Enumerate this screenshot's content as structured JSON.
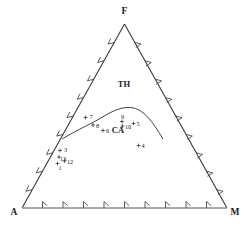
{
  "chart_data": {
    "type": "scatter",
    "title": "",
    "subtitle": "",
    "xlabel": "",
    "ylabel": "",
    "plot_kind": "ternary-afm-diagram",
    "grid": false,
    "legend_position": "none",
    "axis_ranges": {
      "a": [
        0,
        100
      ],
      "f": [
        0,
        100
      ],
      "m": [
        0,
        100
      ]
    },
    "apices": [
      {
        "id": "apex-f",
        "label": "F",
        "position": "top",
        "px": {
          "x": 124.5,
          "y": 14
        }
      },
      {
        "id": "apex-a",
        "label": "A",
        "position": "bottom-left",
        "px": {
          "x": 14,
          "y": 215
        }
      },
      {
        "id": "apex-m",
        "label": "M",
        "position": "bottom-right",
        "px": {
          "x": 235,
          "y": 215
        }
      }
    ],
    "fields": [
      {
        "id": "field-th",
        "label": "TH",
        "px": {
          "x": 124,
          "y": 87
        }
      },
      {
        "id": "field-ca",
        "label": "CA",
        "px": {
          "x": 118,
          "y": 133
        }
      }
    ],
    "ticks_per_edge": 9,
    "divider_curve_px": [
      {
        "x": 62,
        "y": 139
      },
      {
        "x": 76,
        "y": 131
      },
      {
        "x": 90,
        "y": 124
      },
      {
        "x": 101,
        "y": 118
      },
      {
        "x": 111,
        "y": 112
      },
      {
        "x": 121,
        "y": 108
      },
      {
        "x": 131,
        "y": 107
      },
      {
        "x": 140,
        "y": 110
      },
      {
        "x": 148,
        "y": 117
      },
      {
        "x": 155,
        "y": 126
      },
      {
        "x": 163,
        "y": 139
      }
    ],
    "points": [
      {
        "id": "pt-1",
        "label": "1",
        "px": {
          "x": 57.5,
          "y": 163.5
        },
        "label_px": {
          "x": 58.5,
          "y": 169.5
        }
      },
      {
        "id": "pt-13",
        "label": "13",
        "px": {
          "x": 59.0,
          "y": 157.0
        },
        "label_px": {
          "x": 60.0,
          "y": 160.5
        }
      },
      {
        "id": "pt-12",
        "label": "12",
        "px": {
          "x": 64.5,
          "y": 161.0
        },
        "label_px": {
          "x": 67.0,
          "y": 164.0
        }
      },
      {
        "id": "pt-3",
        "label": "3",
        "px": {
          "x": 60.0,
          "y": 150.5
        },
        "label_px": {
          "x": 64.0,
          "y": 152.0
        }
      },
      {
        "id": "pt-7",
        "label": "7",
        "px": {
          "x": 85.5,
          "y": 117.5
        },
        "label_px": {
          "x": 89.5,
          "y": 119.0
        }
      },
      {
        "id": "pt-8",
        "label": "8",
        "px": {
          "x": 93.0,
          "y": 125.0
        },
        "label_px": {
          "x": 96.0,
          "y": 127.5
        }
      },
      {
        "id": "pt-6",
        "label": "6",
        "px": {
          "x": 103.0,
          "y": 130.5
        },
        "label_px": {
          "x": 106.0,
          "y": 133.0
        }
      },
      {
        "id": "pt-9",
        "label": "9",
        "px": {
          "x": 122.0,
          "y": 121.5
        },
        "label_px": {
          "x": 121.0,
          "y": 118.5
        }
      },
      {
        "id": "pt-10",
        "label": "10",
        "px": {
          "x": 122.5,
          "y": 126.0
        },
        "label_px": {
          "x": 125.0,
          "y": 129.0
        }
      },
      {
        "id": "pt-5",
        "label": "5",
        "px": {
          "x": 133.5,
          "y": 123.5
        },
        "label_px": {
          "x": 136.5,
          "y": 125.5
        }
      },
      {
        "id": "pt-4",
        "label": "4",
        "px": {
          "x": 138.5,
          "y": 145.5
        },
        "label_px": {
          "x": 141.5,
          "y": 147.5
        }
      }
    ],
    "colors": {
      "edge": "#3a3a3a",
      "base_edge": "#8e8e8e",
      "tick": "#4a4a4a",
      "curve": "#2e2e2e",
      "text": "#1a1a1a",
      "background": "#ffffff"
    }
  }
}
